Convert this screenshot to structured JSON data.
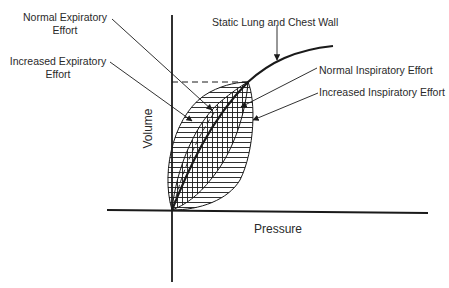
{
  "diagram": {
    "type": "pressure-volume loop diagram",
    "axes": {
      "x_label": "Pressure",
      "y_label": "Volume"
    },
    "labels": {
      "normal_expiratory": [
        "Normal Expiratory",
        "Effort"
      ],
      "increased_expiratory": [
        "Increased Expiratory",
        "Effort"
      ],
      "static": "Static Lung and Chest Wall",
      "normal_inspiratory": "Normal Inspiratory Effort",
      "increased_inspiratory": "Increased Inspiratory Effort"
    },
    "colors": {
      "ink": "#1a1a1a",
      "background": "#ffffff"
    }
  }
}
